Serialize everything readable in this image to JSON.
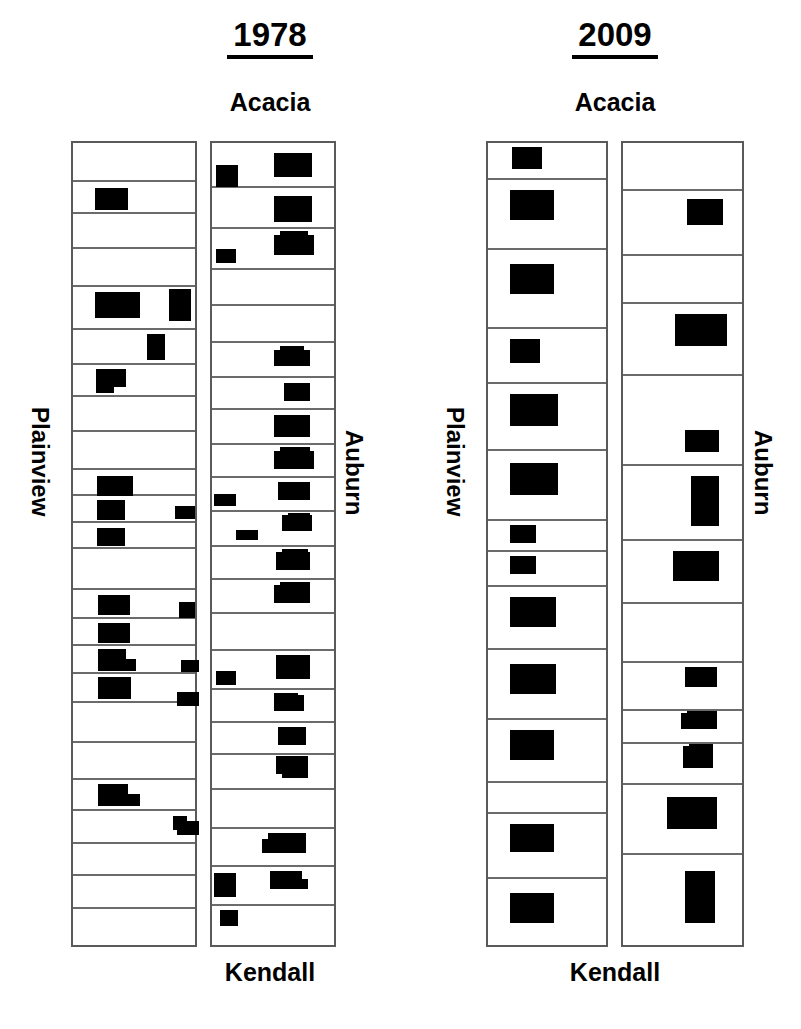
{
  "figure": {
    "background_color": "#ffffff",
    "block_color": "#000000",
    "frame_color": "#5a5a5a",
    "divider_color": "#6b6b6b"
  },
  "panels": [
    {
      "id": "panel-1978",
      "year": "1978",
      "top_label": "Acacia",
      "bottom_label": "Kendall",
      "left_label": "Plainview",
      "right_label": "Auburn",
      "columns": [
        {
          "id": "column-1978-plainview",
          "name": "Plainview",
          "cell_count": 24,
          "cells": [
            {
              "index": 1,
              "blocks": []
            },
            {
              "index": 2,
              "blocks": [
                {
                  "x": 22,
                  "y": 6,
                  "w": 33,
                  "h": 22
                }
              ]
            },
            {
              "index": 3,
              "blocks": []
            },
            {
              "index": 4,
              "blocks": []
            },
            {
              "index": 5,
              "blocks": [
                {
                  "x": 22,
                  "y": 5,
                  "w": 45,
                  "h": 26
                },
                {
                  "x": 96,
                  "y": 2,
                  "w": 22,
                  "h": 32
                }
              ]
            },
            {
              "index": 6,
              "blocks": [
                {
                  "x": 74,
                  "y": 4,
                  "w": 18,
                  "h": 26
                }
              ]
            },
            {
              "index": 7,
              "blocks": [
                {
                  "x": 23,
                  "y": 4,
                  "w": 30,
                  "h": 18
                },
                {
                  "x": 23,
                  "y": 18,
                  "w": 18,
                  "h": 10
                }
              ]
            },
            {
              "index": 8,
              "blocks": []
            },
            {
              "index": 9,
              "blocks": []
            },
            {
              "index": 10,
              "blocks": [
                {
                  "x": 24,
                  "y": 6,
                  "w": 36,
                  "h": 20
                }
              ]
            },
            {
              "index": 11,
              "blocks": [
                {
                  "x": 24,
                  "y": 4,
                  "w": 28,
                  "h": 20
                },
                {
                  "x": 102,
                  "y": 10,
                  "w": 20,
                  "h": 13
                }
              ]
            },
            {
              "index": 12,
              "blocks": [
                {
                  "x": 24,
                  "y": 5,
                  "w": 28,
                  "h": 18
                }
              ]
            },
            {
              "index": 13,
              "blocks": []
            },
            {
              "index": 14,
              "blocks": [
                {
                  "x": 25,
                  "y": 5,
                  "w": 32,
                  "h": 20
                },
                {
                  "x": 106,
                  "y": 12,
                  "w": 16,
                  "h": 16
                }
              ]
            },
            {
              "index": 15,
              "blocks": [
                {
                  "x": 25,
                  "y": 4,
                  "w": 32,
                  "h": 20
                }
              ]
            },
            {
              "index": 16,
              "blocks": [
                {
                  "x": 25,
                  "y": 3,
                  "w": 28,
                  "h": 14
                },
                {
                  "x": 25,
                  "y": 13,
                  "w": 38,
                  "h": 12
                },
                {
                  "x": 108,
                  "y": 14,
                  "w": 18,
                  "h": 12
                }
              ]
            },
            {
              "index": 17,
              "blocks": [
                {
                  "x": 25,
                  "y": 3,
                  "w": 33,
                  "h": 22
                },
                {
                  "x": 104,
                  "y": 18,
                  "w": 22,
                  "h": 14
                }
              ]
            },
            {
              "index": 18,
              "blocks": []
            },
            {
              "index": 19,
              "blocks": []
            },
            {
              "index": 20,
              "blocks": [
                {
                  "x": 25,
                  "y": 4,
                  "w": 30,
                  "h": 14
                },
                {
                  "x": 25,
                  "y": 14,
                  "w": 42,
                  "h": 12
                }
              ]
            },
            {
              "index": 21,
              "blocks": [
                {
                  "x": 100,
                  "y": 5,
                  "w": 14,
                  "h": 14
                },
                {
                  "x": 104,
                  "y": 10,
                  "w": 22,
                  "h": 14
                }
              ]
            },
            {
              "index": 22,
              "blocks": []
            },
            {
              "index": 23,
              "blocks": []
            },
            {
              "index": 24,
              "blocks": []
            }
          ]
        },
        {
          "id": "column-1978-auburn",
          "name": "Auburn",
          "cell_count": 22,
          "cells": [
            {
              "index": 1,
              "blocks": [
                {
                  "x": 4,
                  "y": 22,
                  "w": 22,
                  "h": 22
                },
                {
                  "x": 62,
                  "y": 10,
                  "w": 38,
                  "h": 24
                }
              ]
            },
            {
              "index": 2,
              "blocks": [
                {
                  "x": 62,
                  "y": 8,
                  "w": 38,
                  "h": 26
                }
              ]
            },
            {
              "index": 3,
              "blocks": [
                {
                  "x": 4,
                  "y": 20,
                  "w": 20,
                  "h": 14
                },
                {
                  "x": 62,
                  "y": 6,
                  "w": 40,
                  "h": 20
                },
                {
                  "x": 68,
                  "y": 2,
                  "w": 28,
                  "h": 8
                }
              ]
            },
            {
              "index": 4,
              "blocks": []
            },
            {
              "index": 5,
              "blocks": []
            },
            {
              "index": 6,
              "blocks": [
                {
                  "x": 62,
                  "y": 7,
                  "w": 36,
                  "h": 16
                },
                {
                  "x": 68,
                  "y": 3,
                  "w": 24,
                  "h": 7
                }
              ]
            },
            {
              "index": 7,
              "blocks": [
                {
                  "x": 72,
                  "y": 5,
                  "w": 26,
                  "h": 18
                }
              ]
            },
            {
              "index": 8,
              "blocks": [
                {
                  "x": 62,
                  "y": 5,
                  "w": 36,
                  "h": 22
                }
              ]
            },
            {
              "index": 9,
              "blocks": [
                {
                  "x": 62,
                  "y": 6,
                  "w": 40,
                  "h": 18
                },
                {
                  "x": 68,
                  "y": 2,
                  "w": 30,
                  "h": 8
                }
              ]
            },
            {
              "index": 10,
              "blocks": [
                {
                  "x": 2,
                  "y": 16,
                  "w": 22,
                  "h": 12
                },
                {
                  "x": 66,
                  "y": 4,
                  "w": 32,
                  "h": 18
                }
              ]
            },
            {
              "index": 11,
              "blocks": [
                {
                  "x": 24,
                  "y": 18,
                  "w": 22,
                  "h": 10
                },
                {
                  "x": 70,
                  "y": 3,
                  "w": 30,
                  "h": 16
                },
                {
                  "x": 76,
                  "y": 1,
                  "w": 22,
                  "h": 6
                }
              ]
            },
            {
              "index": 12,
              "blocks": [
                {
                  "x": 64,
                  "y": 5,
                  "w": 34,
                  "h": 18
                },
                {
                  "x": 70,
                  "y": 2,
                  "w": 26,
                  "h": 8
                }
              ]
            },
            {
              "index": 13,
              "blocks": [
                {
                  "x": 62,
                  "y": 5,
                  "w": 36,
                  "h": 18
                },
                {
                  "x": 68,
                  "y": 2,
                  "w": 30,
                  "h": 8
                }
              ]
            },
            {
              "index": 14,
              "blocks": []
            },
            {
              "index": 15,
              "blocks": [
                {
                  "x": 4,
                  "y": 20,
                  "w": 20,
                  "h": 14
                },
                {
                  "x": 64,
                  "y": 4,
                  "w": 34,
                  "h": 24
                }
              ]
            },
            {
              "index": 16,
              "blocks": [
                {
                  "x": 62,
                  "y": 5,
                  "w": 30,
                  "h": 16
                },
                {
                  "x": 62,
                  "y": 3,
                  "w": 24,
                  "h": 8
                }
              ]
            },
            {
              "index": 17,
              "blocks": [
                {
                  "x": 66,
                  "y": 4,
                  "w": 28,
                  "h": 18
                }
              ]
            },
            {
              "index": 18,
              "blocks": [
                {
                  "x": 64,
                  "y": 1,
                  "w": 32,
                  "h": 18
                },
                {
                  "x": 70,
                  "y": 1,
                  "w": 26,
                  "h": 22
                }
              ]
            },
            {
              "index": 19,
              "blocks": []
            },
            {
              "index": 20,
              "blocks": [
                {
                  "x": 50,
                  "y": 10,
                  "w": 44,
                  "h": 14
                },
                {
                  "x": 56,
                  "y": 4,
                  "w": 38,
                  "h": 12
                }
              ]
            },
            {
              "index": 21,
              "blocks": [
                {
                  "x": 2,
                  "y": 6,
                  "w": 22,
                  "h": 24
                },
                {
                  "x": 58,
                  "y": 4,
                  "w": 32,
                  "h": 14
                },
                {
                  "x": 58,
                  "y": 12,
                  "w": 38,
                  "h": 10
                }
              ]
            },
            {
              "index": 22,
              "blocks": [
                {
                  "x": 8,
                  "y": 4,
                  "w": 18,
                  "h": 16
                }
              ]
            }
          ]
        }
      ]
    },
    {
      "id": "panel-2009",
      "year": "2009",
      "top_label": "Acacia",
      "bottom_label": "Kendall",
      "left_label": "Plainview",
      "right_label": "Auburn",
      "columns": [
        {
          "id": "column-2009-plainview",
          "name": "Plainview",
          "cell_count": 14,
          "cells": [
            {
              "index": 1,
              "blocks": [
                {
                  "x": 24,
                  "y": 4,
                  "w": 30,
                  "h": 22
                }
              ]
            },
            {
              "index": 2,
              "blocks": [
                {
                  "x": 22,
                  "y": 10,
                  "w": 44,
                  "h": 30
                }
              ]
            },
            {
              "index": 3,
              "blocks": [
                {
                  "x": 22,
                  "y": 14,
                  "w": 44,
                  "h": 30
                }
              ]
            },
            {
              "index": 4,
              "blocks": [
                {
                  "x": 22,
                  "y": 10,
                  "w": 30,
                  "h": 24
                }
              ]
            },
            {
              "index": 5,
              "blocks": [
                {
                  "x": 22,
                  "y": 10,
                  "w": 48,
                  "h": 32
                }
              ]
            },
            {
              "index": 6,
              "blocks": [
                {
                  "x": 22,
                  "y": 12,
                  "w": 48,
                  "h": 32
                }
              ]
            },
            {
              "index": 7,
              "blocks": [
                {
                  "x": 22,
                  "y": 4,
                  "w": 26,
                  "h": 18
                }
              ]
            },
            {
              "index": 8,
              "blocks": [
                {
                  "x": 22,
                  "y": 4,
                  "w": 26,
                  "h": 18
                }
              ]
            },
            {
              "index": 9,
              "blocks": [
                {
                  "x": 22,
                  "y": 10,
                  "w": 46,
                  "h": 30
                }
              ]
            },
            {
              "index": 10,
              "blocks": [
                {
                  "x": 22,
                  "y": 14,
                  "w": 46,
                  "h": 30
                }
              ]
            },
            {
              "index": 11,
              "blocks": [
                {
                  "x": 22,
                  "y": 10,
                  "w": 44,
                  "h": 30
                }
              ]
            },
            {
              "index": 12,
              "blocks": []
            },
            {
              "index": 13,
              "blocks": [
                {
                  "x": 22,
                  "y": 10,
                  "w": 44,
                  "h": 28
                }
              ]
            },
            {
              "index": 14,
              "blocks": [
                {
                  "x": 22,
                  "y": 14,
                  "w": 44,
                  "h": 30
                }
              ]
            }
          ]
        },
        {
          "id": "column-2009-auburn",
          "name": "Auburn",
          "cell_count": 13,
          "cells": [
            {
              "index": 1,
              "blocks": []
            },
            {
              "index": 2,
              "blocks": [
                {
                  "x": 64,
                  "y": 8,
                  "w": 36,
                  "h": 26
                }
              ]
            },
            {
              "index": 3,
              "blocks": []
            },
            {
              "index": 4,
              "blocks": [
                {
                  "x": 52,
                  "y": 10,
                  "w": 52,
                  "h": 32
                }
              ]
            },
            {
              "index": 5,
              "blocks": [
                {
                  "x": 62,
                  "y": 54,
                  "w": 34,
                  "h": 22
                }
              ]
            },
            {
              "index": 6,
              "blocks": [
                {
                  "x": 68,
                  "y": 10,
                  "w": 28,
                  "h": 50
                }
              ]
            },
            {
              "index": 7,
              "blocks": [
                {
                  "x": 50,
                  "y": 10,
                  "w": 46,
                  "h": 30
                }
              ]
            },
            {
              "index": 8,
              "blocks": []
            },
            {
              "index": 9,
              "blocks": [
                {
                  "x": 62,
                  "y": 4,
                  "w": 32,
                  "h": 20
                }
              ]
            },
            {
              "index": 10,
              "blocks": [
                {
                  "x": 58,
                  "y": 2,
                  "w": 36,
                  "h": 16
                },
                {
                  "x": 64,
                  "y": 0,
                  "w": 30,
                  "h": 8
                }
              ]
            },
            {
              "index": 11,
              "blocks": [
                {
                  "x": 60,
                  "y": 2,
                  "w": 30,
                  "h": 22
                },
                {
                  "x": 66,
                  "y": 0,
                  "w": 24,
                  "h": 8
                }
              ]
            },
            {
              "index": 12,
              "blocks": [
                {
                  "x": 44,
                  "y": 12,
                  "w": 50,
                  "h": 32
                }
              ]
            },
            {
              "index": 13,
              "blocks": [
                {
                  "x": 62,
                  "y": 16,
                  "w": 30,
                  "h": 52
                }
              ]
            }
          ]
        }
      ]
    }
  ]
}
